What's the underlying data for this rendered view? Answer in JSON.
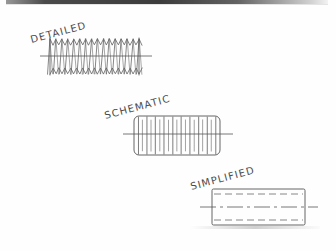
{
  "sheet": {
    "title": "Screw Thread Representation Conventions",
    "width": 336,
    "height": 251,
    "paper_color": "#fefefe",
    "ink_color": "#4a4a4a",
    "medium": "hand-drawn pencil sketch on white paper"
  },
  "figures": [
    {
      "id": "detailed",
      "label": "DETAILED",
      "label_rotation_deg": -15,
      "label_x": 32,
      "label_y": 34,
      "description": "Detailed thread representation drawn as a continuous zig-zag helix profile with pointed crests and roots along the full length of the shaft.",
      "body": {
        "x": 50,
        "y": 39,
        "width": 89,
        "height": 35
      },
      "crest_count": 15,
      "centerline": {
        "x1": 40,
        "x2": 152,
        "y": 56
      },
      "style": "zigzag-helix"
    },
    {
      "id": "schematic",
      "label": "SCHEMATIC",
      "label_rotation_deg": -15,
      "label_x": 106,
      "label_y": 110,
      "description": "Schematic thread representation drawn as a rounded-corner rectangle crossed by alternating long and short vertical lines denoting thread roots and crests.",
      "body": {
        "x": 134,
        "y": 116,
        "width": 86,
        "height": 39
      },
      "corner_radius": 5,
      "tick_count": 20,
      "tick_pattern": "alternating long (root) and short (crest) vertical lines",
      "centerline": {
        "x1": 123,
        "x2": 233,
        "y": 134
      },
      "style": "alternating-vertical-ticks"
    },
    {
      "id": "simplified",
      "label": "SIMPLIFIED",
      "label_rotation_deg": -15,
      "label_x": 192,
      "label_y": 181,
      "description": "Simplified thread representation drawn as a plain rectangle with dashed hidden lines set in from the top and bottom edges indicating the thread depth.",
      "body": {
        "x": 212,
        "y": 189,
        "width": 93,
        "height": 36
      },
      "dashed_inset": 5,
      "dashed_lines": 2,
      "centerline": {
        "x1": 200,
        "x2": 318,
        "y": 207
      },
      "style": "rectangle-with-dashed-depth-lines"
    }
  ],
  "icons": {
    "detailed": "thread-detailed-icon",
    "schematic": "thread-schematic-icon",
    "simplified": "thread-simplified-icon"
  }
}
